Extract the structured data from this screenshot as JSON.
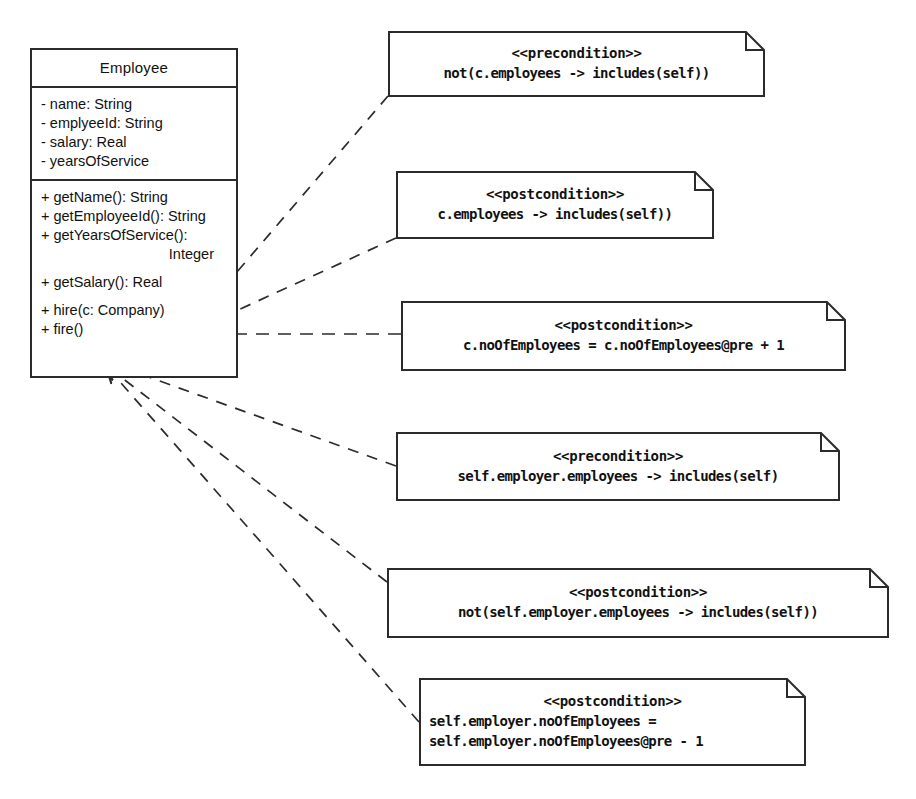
{
  "diagram": {
    "type": "uml-class-diagram",
    "stroke_color": "#2b2b2b",
    "background_color": "#ffffff"
  },
  "class_box": {
    "name": "Employee",
    "attributes": [
      "- name: String",
      "- emplyeeId: String",
      "- salary: Real",
      "- yearsOfService"
    ],
    "operations": [
      {
        "text": "+ getName(): String",
        "gap": false,
        "align": "left"
      },
      {
        "text": "+ getEmployeeId(): String",
        "gap": false,
        "align": "left"
      },
      {
        "text": "+ getYearsOfService():",
        "gap": false,
        "align": "left"
      },
      {
        "text": "Integer",
        "gap": false,
        "align": "right"
      },
      {
        "text": "+ getSalary(): Real",
        "gap": true,
        "align": "left"
      },
      {
        "text": "+ hire(c: Company)",
        "gap": true,
        "align": "left"
      },
      {
        "text": "+ fire()",
        "gap": false,
        "align": "left"
      }
    ]
  },
  "notes": [
    {
      "id": "note-precondition-hire-not-includes",
      "stereotype": "<<precondition>>",
      "lines": [
        "not(c.employees -> includes(self))"
      ],
      "attached_to": "+ hire(c: Company)"
    },
    {
      "id": "note-postcondition-hire-includes",
      "stereotype": "<<postcondition>>",
      "lines": [
        "c.employees -> includes(self))"
      ],
      "attached_to": "+ hire(c: Company)"
    },
    {
      "id": "note-postcondition-hire-count",
      "stereotype": "<<postcondition>>",
      "lines": [
        "c.noOfEmployees = c.noOfEmployees@pre + 1"
      ],
      "attached_to": "+ hire(c: Company)"
    },
    {
      "id": "note-precondition-fire-includes",
      "stereotype": "<<precondition>>",
      "lines": [
        "self.employer.employees -> includes(self)"
      ],
      "attached_to": "+ fire()"
    },
    {
      "id": "note-postcondition-fire-not-includes",
      "stereotype": "<<postcondition>>",
      "lines": [
        "not(self.employer.employees -> includes(self))"
      ],
      "attached_to": "+ fire()"
    },
    {
      "id": "note-postcondition-fire-count",
      "stereotype": "<<postcondition>>",
      "lines": [
        "self.employer.noOfEmployees =",
        "self.employer.noOfEmployees@pre - 1"
      ],
      "attached_to": "+ fire()"
    }
  ]
}
